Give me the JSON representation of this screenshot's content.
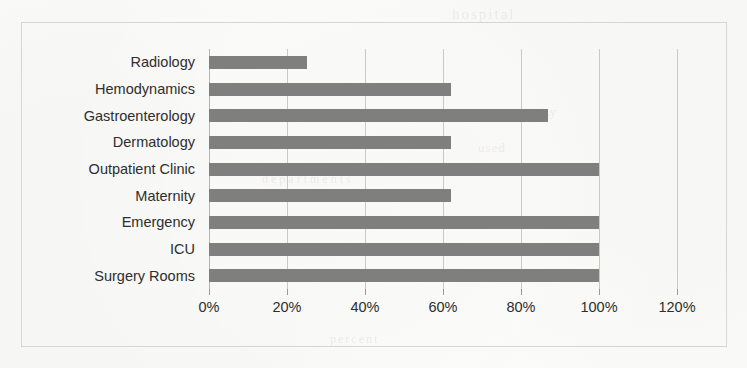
{
  "chart_data": {
    "type": "bar",
    "orientation": "horizontal",
    "title": "",
    "subtitle": "",
    "xlabel": "",
    "ylabel": "",
    "categories": [
      "Radiology",
      "Hemodynamics",
      "Gastroenterology",
      "Dermatology",
      "Outpatient Clinic",
      "Maternity",
      "Emergency",
      "ICU",
      "Surgery Rooms"
    ],
    "values": [
      25,
      62,
      87,
      62,
      100,
      62,
      100,
      100,
      100
    ],
    "value_unit": "%",
    "xlim": [
      0,
      120
    ],
    "tick_labels": [
      "0%",
      "20%",
      "40%",
      "60%",
      "80%",
      "100%",
      "120%"
    ],
    "tick_values": [
      0,
      20,
      40,
      60,
      80,
      100,
      120
    ],
    "grid": "vertical",
    "legend": "none",
    "bar_color": "#7f7f7f",
    "gridline_color": "#c9c9c5",
    "frame_color": "#d6d6d2",
    "background_color": "#fbfbf9",
    "text_color": "#2e2e2e"
  },
  "ghost_text": {
    "top": "hospital",
    "line1": "capacity",
    "line2": "used",
    "line3": "departments",
    "line4": "utilization",
    "line5": "percent"
  }
}
